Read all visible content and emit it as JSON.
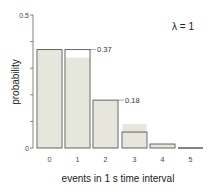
{
  "chart_data": {
    "type": "bar",
    "title": "",
    "annotation": "λ = 1",
    "xlabel": "events in 1 s time  interval",
    "ylabel": "probability",
    "ylim": [
      0,
      0.5
    ],
    "yticks": [
      0,
      0.1,
      0.2,
      0.3,
      0.4,
      0.5
    ],
    "ytick_labels": [
      "0",
      "",
      "",
      "",
      "",
      "0.5"
    ],
    "categories": [
      "0",
      "1",
      "2",
      "3",
      "4",
      "5"
    ],
    "series": [
      {
        "name": "Poisson probability (outlined)",
        "values": [
          0.37,
          0.37,
          0.18,
          0.06,
          0.015,
          0.003
        ]
      },
      {
        "name": "Observed frequency (shaded)",
        "values": [
          0.37,
          0.34,
          0.18,
          0.09,
          0.015,
          0.0
        ]
      }
    ],
    "data_labels": [
      {
        "category": "1",
        "text": "0.37"
      },
      {
        "category": "2",
        "text": "0.18"
      }
    ],
    "grid": false,
    "legend": "none"
  }
}
